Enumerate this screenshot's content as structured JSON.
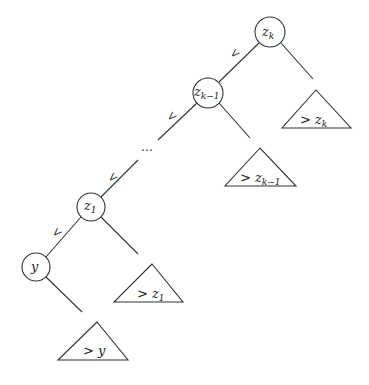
{
  "diagram": {
    "type": "binary-search-tree-left-spine",
    "nodes": [
      {
        "id": "zk",
        "label": "z",
        "sub": "k"
      },
      {
        "id": "zk1",
        "label": "z",
        "sub": "k−1"
      },
      {
        "id": "z1",
        "label": "z",
        "sub": "1"
      },
      {
        "id": "y",
        "label": "y",
        "sub": ""
      }
    ],
    "subtrees": [
      {
        "id": "gt-zk",
        "prefix": ">",
        "label": "z",
        "sub": "k"
      },
      {
        "id": "gt-zk1",
        "prefix": ">",
        "label": "z",
        "sub": "k−1"
      },
      {
        "id": "gt-z1",
        "prefix": ">",
        "label": "z",
        "sub": "1"
      },
      {
        "id": "gt-y",
        "prefix": ">",
        "label": "y",
        "sub": ""
      }
    ],
    "edge_labels": {
      "less": "<"
    },
    "ellipsis": "…"
  }
}
